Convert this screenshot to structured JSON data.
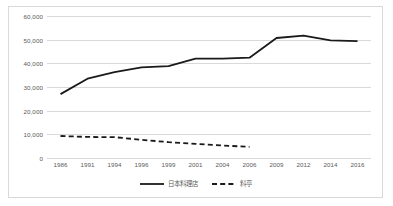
{
  "chart_data": {
    "type": "line",
    "title": "",
    "subtitle": "",
    "xlabel": "",
    "ylabel": "",
    "categories": [
      "1986",
      "1991",
      "1994",
      "1996",
      "1999",
      "2001",
      "2004",
      "2006",
      "2009",
      "2012",
      "2014",
      "2016"
    ],
    "ylim": [
      0,
      60000
    ],
    "y_ticks": [
      0,
      10000,
      20000,
      30000,
      40000,
      50000,
      60000
    ],
    "y_tick_labels": [
      "0",
      "10,000",
      "20,000",
      "30,000",
      "40,000",
      "50,000",
      "60,000"
    ],
    "grid": "horizontal",
    "legend_position": "bottom-center",
    "series": [
      {
        "name": "日本料理店",
        "style": "solid",
        "color": "#1a1a1a",
        "values": [
          27000,
          33500,
          36300,
          38300,
          38800,
          42000,
          42000,
          42400,
          50700,
          51700,
          49700,
          49400
        ]
      },
      {
        "name": "料亭",
        "style": "dashed",
        "color": "#1a1a1a",
        "values": [
          9300,
          8900,
          8800,
          7700,
          6700,
          6000,
          5300,
          4700,
          null,
          null,
          null,
          null
        ]
      }
    ]
  },
  "legend": {
    "entries": [
      {
        "label": "日本料理店",
        "marker": "solid-line-marker"
      },
      {
        "label": "料亭",
        "marker": "dashed-line-marker"
      }
    ]
  },
  "colors": {
    "gridline": "#d9d9d9",
    "border": "#d9d9d9",
    "tick_text": "#595959",
    "series_line": "#1a1a1a",
    "background": "#ffffff"
  }
}
